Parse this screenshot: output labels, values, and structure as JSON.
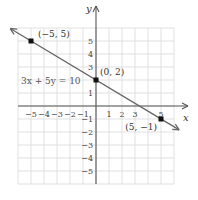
{
  "chart_data": {
    "type": "line",
    "title": "",
    "equation": "3x + 5y = 10",
    "xlabel": "x",
    "ylabel": "y",
    "xlim": [
      -6,
      6
    ],
    "ylim": [
      -6,
      6
    ],
    "grid": true,
    "x_ticks": [
      "−5",
      "−4",
      "−3",
      "−2",
      "−1",
      "1",
      "2",
      "3",
      "5"
    ],
    "y_ticks": [
      "5",
      "4",
      "3",
      "1",
      "−1",
      "−2",
      "−3",
      "−4",
      "−5"
    ],
    "points": [
      {
        "x": -5,
        "y": 5,
        "label": "(−5, 5)"
      },
      {
        "x": 0,
        "y": 2,
        "label": "(0, 2)"
      },
      {
        "x": 5,
        "y": -1,
        "label": "(5, −1)"
      }
    ],
    "line": {
      "slope": -0.6,
      "intercept": 2,
      "arrows": "both"
    }
  },
  "colors": {
    "grid": "#d9d9d9",
    "axis": "#555555",
    "line": "#666666",
    "point": "#111111"
  }
}
